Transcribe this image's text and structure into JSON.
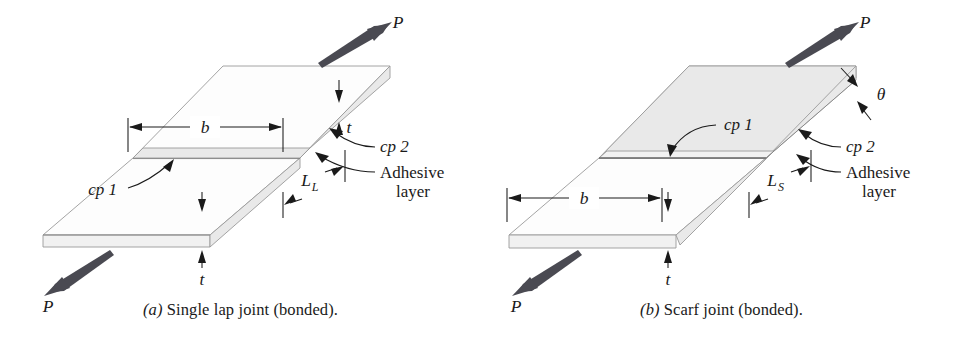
{
  "figure": {
    "background_color": "#ffffff",
    "ink_color": "#1a1a1a",
    "plate_face_color": "#fdfdfd",
    "plate_edge_color": "#e9e9e9",
    "adhesive_color": "#8f8f8f",
    "force_arrow_color": "#4a4a52"
  },
  "panel_a": {
    "caption_label": "(a)",
    "caption_text": "Single lap joint (bonded).",
    "force_top": "P",
    "force_bottom": "P",
    "dim_width": "b",
    "thickness_top": "t",
    "thickness_bottom": "t",
    "overlap_length": "L",
    "overlap_length_sub": "L",
    "cp1": "cp 1",
    "cp2": "cp 2",
    "adhesive_line1": "Adhesive",
    "adhesive_line2": "layer"
  },
  "panel_b": {
    "caption_label": "(b)",
    "caption_text": "Scarf joint (bonded).",
    "force_top": "P",
    "force_bottom": "P",
    "dim_width": "b",
    "thickness": "t",
    "angle": "θ",
    "scarf_length": "L",
    "scarf_length_sub": "S",
    "cp1": "cp 1",
    "cp2": "cp 2",
    "adhesive_line1": "Adhesive",
    "adhesive_line2": "layer"
  }
}
